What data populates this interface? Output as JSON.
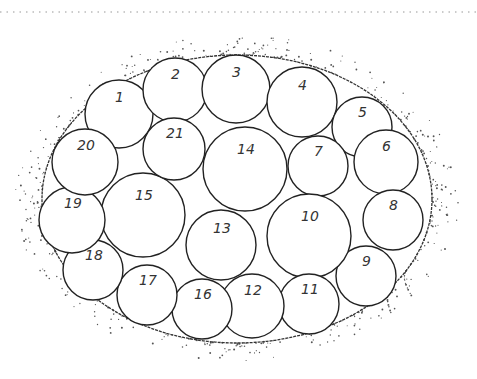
{
  "diagram": {
    "top_rule": {
      "y": 12,
      "style": "dotted",
      "color": "#bbbbbb"
    },
    "container": {
      "shape": "ellipse",
      "cx": 237,
      "cy": 199,
      "rx": 195,
      "ry": 144,
      "stroke": "#333333"
    },
    "circles": [
      {
        "label": "1",
        "cx": 119,
        "cy": 114,
        "r": 34
      },
      {
        "label": "2",
        "cx": 175,
        "cy": 90,
        "r": 32
      },
      {
        "label": "3",
        "cx": 236,
        "cy": 89,
        "r": 34
      },
      {
        "label": "4",
        "cx": 302,
        "cy": 102,
        "r": 35
      },
      {
        "label": "5",
        "cx": 362,
        "cy": 127,
        "r": 30
      },
      {
        "label": "6",
        "cx": 386,
        "cy": 162,
        "r": 32
      },
      {
        "label": "7",
        "cx": 318,
        "cy": 166,
        "r": 30
      },
      {
        "label": "8",
        "cx": 393,
        "cy": 220,
        "r": 30
      },
      {
        "label": "9",
        "cx": 366,
        "cy": 276,
        "r": 30
      },
      {
        "label": "10",
        "cx": 309,
        "cy": 236,
        "r": 42
      },
      {
        "label": "11",
        "cx": 309,
        "cy": 304,
        "r": 30
      },
      {
        "label": "12",
        "cx": 252,
        "cy": 306,
        "r": 32
      },
      {
        "label": "13",
        "cx": 221,
        "cy": 245,
        "r": 35
      },
      {
        "label": "14",
        "cx": 245,
        "cy": 169,
        "r": 42
      },
      {
        "label": "15",
        "cx": 143,
        "cy": 215,
        "r": 42
      },
      {
        "label": "16",
        "cx": 202,
        "cy": 309,
        "r": 30
      },
      {
        "label": "17",
        "cx": 147,
        "cy": 295,
        "r": 30
      },
      {
        "label": "18",
        "cx": 93,
        "cy": 270,
        "r": 30
      },
      {
        "label": "19",
        "cx": 72,
        "cy": 220,
        "r": 33
      },
      {
        "label": "20",
        "cx": 85,
        "cy": 162,
        "r": 33
      },
      {
        "label": "21",
        "cx": 174,
        "cy": 149,
        "r": 31
      }
    ]
  }
}
